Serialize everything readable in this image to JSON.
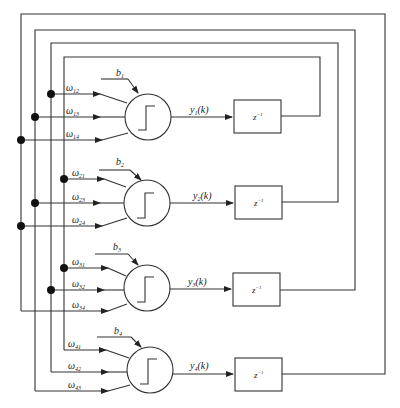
{
  "diagram": {
    "neurons": [
      {
        "id": 1,
        "bias": "b",
        "bias_sub": "1",
        "output": "y",
        "output_sub": "1",
        "output_arg": "(k)",
        "weights": [
          {
            "sym": "ω",
            "sub": "12"
          },
          {
            "sym": "ω",
            "sub": "13"
          },
          {
            "sym": "ω",
            "sub": "14"
          }
        ],
        "delay": "z",
        "delay_sup": "−1"
      },
      {
        "id": 2,
        "bias": "b",
        "bias_sub": "2",
        "output": "y",
        "output_sub": "2",
        "output_arg": "(k)",
        "weights": [
          {
            "sym": "ω",
            "sub": "21"
          },
          {
            "sym": "ω",
            "sub": "23"
          },
          {
            "sym": "ω",
            "sub": "24"
          }
        ],
        "delay": "z",
        "delay_sup": "−1"
      },
      {
        "id": 3,
        "bias": "b",
        "bias_sub": "3",
        "output": "y",
        "output_sub": "3",
        "output_arg": "(k)",
        "weights": [
          {
            "sym": "ω",
            "sub": "31"
          },
          {
            "sym": "ω",
            "sub": "32"
          },
          {
            "sym": "ω",
            "sub": "34"
          }
        ],
        "delay": "z",
        "delay_sup": "−1"
      },
      {
        "id": 4,
        "bias": "b",
        "bias_sub": "4",
        "output": "y",
        "output_sub": "4",
        "output_arg": "(k)",
        "weights": [
          {
            "sym": "ω",
            "sub": "41"
          },
          {
            "sym": "ω",
            "sub": "42"
          },
          {
            "sym": "ω",
            "sub": "43"
          }
        ],
        "delay": "z",
        "delay_sup": "−1"
      }
    ],
    "activation": "step-function-icon",
    "colors": {
      "line": "#333333",
      "background": "#ffffff",
      "junction": "#111111"
    }
  }
}
